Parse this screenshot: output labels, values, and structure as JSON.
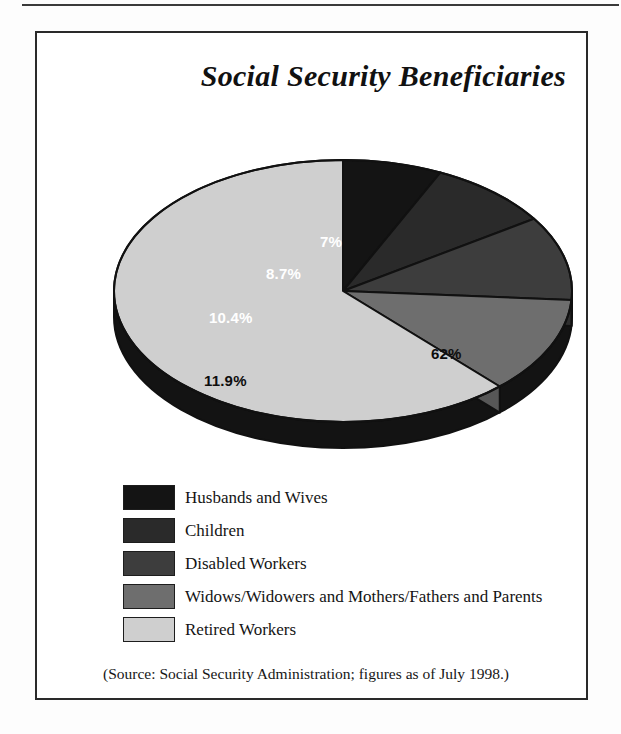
{
  "figure": {
    "title": "Social Security Beneficiaries",
    "source_note": "(Source:  Social Security Administration; figures as of July 1998.)"
  },
  "chart_data": {
    "type": "pie",
    "title": "Social Security Beneficiaries",
    "three_d": true,
    "legend_position": "bottom-left",
    "grid": false,
    "unit": "percent",
    "categories": [
      "Husbands and Wives",
      "Children",
      "Disabled Workers",
      "Widows/Widowers and Mothers/Fathers and Parents",
      "Retired Workers"
    ],
    "values": [
      7,
      8.7,
      10.4,
      11.9,
      62
    ],
    "value_labels": [
      "7%",
      "8.7%",
      "10.4%",
      "11.9%",
      "62%"
    ],
    "colors": [
      "#141414",
      "#2a2a2a",
      "#3d3d3d",
      "#6e6e6e",
      "#cfcfcf"
    ],
    "label_text_colors": [
      "#ffffff",
      "#ffffff",
      "#ffffff",
      "#0d0d0d",
      "#0d0d0d"
    ],
    "slices": [
      {
        "label": "Husbands and Wives",
        "value": 7,
        "display": "7%",
        "color": "#141414"
      },
      {
        "label": "Children",
        "value": 8.7,
        "display": "8.7%",
        "color": "#2a2a2a"
      },
      {
        "label": "Disabled Workers",
        "value": 10.4,
        "display": "10.4%",
        "color": "#3d3d3d"
      },
      {
        "label": "Widows/Widowers and Mothers/Fathers and Parents",
        "value": 11.9,
        "display": "11.9%",
        "color": "#6e6e6e"
      },
      {
        "label": "Retired Workers",
        "value": 62,
        "display": "62%",
        "color": "#cfcfcf"
      }
    ]
  },
  "legend": {
    "items": [
      {
        "label": "Husbands and Wives",
        "color": "#141414"
      },
      {
        "label": "Children",
        "color": "#2a2a2a"
      },
      {
        "label": "Disabled Workers",
        "color": "#3d3d3d"
      },
      {
        "label": "Widows/Widowers and Mothers/Fathers and Parents",
        "color": "#6e6e6e"
      },
      {
        "label": "Retired Workers",
        "color": "#cfcfcf"
      }
    ]
  }
}
